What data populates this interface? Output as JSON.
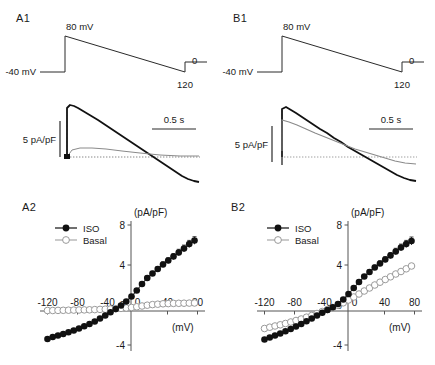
{
  "figure": {
    "panels": [
      {
        "id": "A1",
        "letter": "A1"
      },
      {
        "id": "B1",
        "letter": "B1"
      },
      {
        "id": "A2",
        "letter": "A2"
      },
      {
        "id": "B2",
        "letter": "B2"
      }
    ]
  },
  "protocol_A1": {
    "letter": "A1",
    "holding_label": "-40 mV",
    "peak_label": "80 mV",
    "end_label": "0",
    "ramp_end_label": "120"
  },
  "protocol_B1": {
    "letter": "B1",
    "holding_label": "-40 mV",
    "peak_label": "80 mV",
    "end_label": "0",
    "ramp_end_label": "120"
  },
  "trace_A1": {
    "y_scale_label": "5 pA/pF",
    "x_scale_label": "0.5 s"
  },
  "trace_B1": {
    "y_scale_label": "5 pA/pF",
    "x_scale_label": "0.5 s"
  },
  "legend": {
    "iso_label": "ISO",
    "basal_label": "Basal",
    "iso_color": "#111111",
    "basal_color": "#a8a8a8"
  },
  "chart_data": [
    {
      "id": "A2",
      "type": "scatter",
      "title": "A2",
      "xlabel": "(mV)",
      "ylabel": "(pA/pF)",
      "xlim": [
        -130,
        90
      ],
      "ylim": [
        -4.6,
        8.4
      ],
      "xticks": [
        -120,
        -80,
        -40,
        0,
        40,
        80
      ],
      "xticklabels": [
        "-120",
        "-80",
        "-40",
        "0",
        "40",
        "30"
      ],
      "yticks": [
        -4,
        0,
        4,
        8
      ],
      "yticklabels": [
        "-4",
        "0",
        "4",
        "8"
      ],
      "grid": false,
      "legend_position": "upper-left",
      "series": [
        {
          "name": "ISO",
          "marker": "filled-circle",
          "color": "#111111",
          "x": [
            -120,
            -113,
            -106,
            -99,
            -92,
            -85,
            -78,
            -71,
            -64,
            -57,
            -50,
            -43,
            -36,
            -29,
            -22,
            -15,
            -8,
            -1,
            6,
            13,
            20,
            27,
            34,
            41,
            48,
            55,
            62,
            69,
            76
          ],
          "y": [
            -3.4,
            -3.2,
            -3.05,
            -2.9,
            -2.72,
            -2.55,
            -2.35,
            -2.12,
            -1.9,
            -1.65,
            -1.35,
            -1.05,
            -0.72,
            -0.4,
            -0.05,
            0.35,
            0.85,
            1.45,
            2.1,
            2.7,
            3.15,
            3.6,
            4.05,
            4.45,
            4.85,
            5.25,
            5.65,
            6.1,
            6.45
          ],
          "err": [
            0,
            0,
            0,
            0,
            0,
            0,
            0,
            0,
            0,
            0,
            0,
            0,
            0,
            0,
            0,
            0,
            0,
            0,
            0.18,
            0.2,
            0.22,
            0.24,
            0.26,
            0.28,
            0.3,
            0.32,
            0.34,
            0.36,
            0.38
          ]
        },
        {
          "name": "Basal",
          "marker": "open-circle",
          "color": "#a8a8a8",
          "x": [
            -120,
            -113,
            -106,
            -99,
            -92,
            -85,
            -78,
            -71,
            -64,
            -57,
            -50,
            -43,
            -36,
            -29,
            -22,
            -15,
            -8,
            -1,
            6,
            13,
            20,
            27,
            34,
            41,
            48,
            55,
            62,
            69,
            76
          ],
          "y": [
            -0.55,
            -0.55,
            -0.54,
            -0.53,
            -0.52,
            -0.51,
            -0.5,
            -0.49,
            -0.48,
            -0.46,
            -0.44,
            -0.42,
            -0.4,
            -0.37,
            -0.34,
            -0.3,
            -0.25,
            -0.18,
            -0.1,
            -0.02,
            0.04,
            0.08,
            0.12,
            0.14,
            0.16,
            0.17,
            0.18,
            0.19,
            0.2
          ],
          "err": [
            0,
            0,
            0,
            0,
            0,
            0,
            0,
            0,
            0,
            0,
            0,
            0,
            0,
            0,
            0,
            0,
            0,
            0,
            0,
            0,
            0,
            0,
            0,
            0,
            0,
            0,
            0,
            0,
            0
          ]
        }
      ]
    },
    {
      "id": "B2",
      "type": "scatter",
      "title": "B2",
      "xlabel": "(mV)",
      "ylabel": "(pA/pF)",
      "xlim": [
        -130,
        90
      ],
      "ylim": [
        -4.6,
        8.4
      ],
      "xticks": [
        -120,
        -80,
        -40,
        0,
        40,
        80
      ],
      "xticklabels": [
        "-120",
        "-80",
        "-40",
        "0",
        "40",
        "80"
      ],
      "yticks": [
        -4,
        0,
        4,
        8
      ],
      "yticklabels": [
        "-4",
        "0",
        "4",
        "8"
      ],
      "grid": false,
      "legend_position": "upper-left",
      "series": [
        {
          "name": "ISO",
          "marker": "filled-circle",
          "color": "#111111",
          "x": [
            -120,
            -113,
            -106,
            -99,
            -92,
            -85,
            -78,
            -71,
            -64,
            -57,
            -50,
            -43,
            -36,
            -29,
            -22,
            -15,
            -8,
            -1,
            6,
            13,
            20,
            27,
            34,
            41,
            48,
            55,
            62,
            69,
            76
          ],
          "y": [
            -3.45,
            -3.25,
            -3.05,
            -2.85,
            -2.62,
            -2.4,
            -2.15,
            -1.9,
            -1.62,
            -1.35,
            -1.05,
            -0.78,
            -0.5,
            -0.22,
            0.1,
            0.55,
            1.1,
            1.7,
            2.3,
            2.85,
            3.3,
            3.75,
            4.15,
            4.55,
            4.95,
            5.35,
            5.75,
            6.1,
            6.4
          ],
          "err": [
            0,
            0,
            0,
            0,
            0,
            0,
            0,
            0,
            0,
            0,
            0,
            0,
            0,
            0,
            0,
            0,
            0,
            0,
            0.18,
            0.2,
            0.22,
            0.24,
            0.26,
            0.28,
            0.3,
            0.32,
            0.34,
            0.36,
            0.4
          ]
        },
        {
          "name": "Basal",
          "marker": "open-circle",
          "color": "#a8a8a8",
          "x": [
            -120,
            -113,
            -106,
            -99,
            -92,
            -85,
            -78,
            -71,
            -64,
            -57,
            -50,
            -43,
            -36,
            -29,
            -22,
            -15,
            -8,
            -1,
            6,
            13,
            20,
            27,
            34,
            41,
            48,
            55,
            62,
            69,
            76
          ],
          "y": [
            -2.35,
            -2.22,
            -2.1,
            -1.98,
            -1.85,
            -1.7,
            -1.55,
            -1.4,
            -1.22,
            -1.05,
            -0.85,
            -0.65,
            -0.45,
            -0.25,
            -0.02,
            0.22,
            0.5,
            0.8,
            1.1,
            1.4,
            1.7,
            2.0,
            2.28,
            2.55,
            2.82,
            3.1,
            3.35,
            3.62,
            3.9
          ],
          "err": [
            0,
            0,
            0,
            0,
            0,
            0,
            0,
            0,
            0,
            0,
            0,
            0,
            0,
            0,
            0,
            0,
            0,
            0,
            0,
            0,
            0,
            0,
            0,
            0,
            0,
            0,
            0,
            0,
            0
          ]
        }
      ]
    }
  ]
}
